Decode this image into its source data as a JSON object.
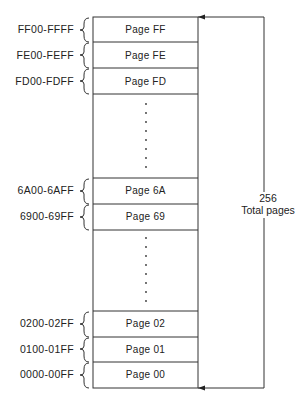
{
  "diagram": {
    "type": "memory-page-map",
    "pages_top": [
      {
        "label": "Page FF",
        "range": "FF00-FFFF"
      },
      {
        "label": "Page FE",
        "range": "FE00-FEFF"
      },
      {
        "label": "Page FD",
        "range": "FD00-FDFF"
      }
    ],
    "pages_middle": [
      {
        "label": "Page 6A",
        "range": "6A00-6AFF"
      },
      {
        "label": "Page 69",
        "range": "6900-69FF"
      }
    ],
    "pages_bottom": [
      {
        "label": "Page 02",
        "range": "0200-02FF"
      },
      {
        "label": "Page 01",
        "range": "0100-01FF"
      },
      {
        "label": "Page 00",
        "range": "0000-00FF"
      }
    ],
    "total": {
      "count": "256",
      "text": "Total pages"
    },
    "colors": {
      "line": "#333333",
      "background": "#ffffff"
    }
  }
}
